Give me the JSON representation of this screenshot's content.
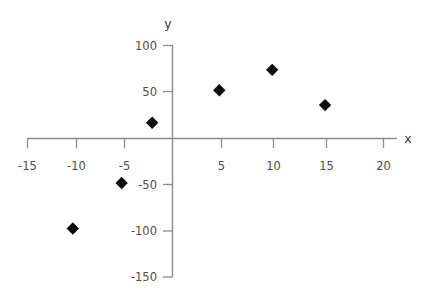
{
  "chart_data": {
    "type": "scatter",
    "title": "",
    "xlabel": "x",
    "ylabel": "y",
    "xlim": [
      -15,
      20
    ],
    "ylim": [
      -150,
      100
    ],
    "xticks": [
      -15,
      -10,
      -5,
      5,
      10,
      15,
      20
    ],
    "yticks": [
      100,
      50,
      -50,
      -100,
      -150
    ],
    "xtick_labels": [
      "-15",
      "-10",
      "-5",
      "5",
      "10",
      "15",
      "20"
    ],
    "ytick_labels": [
      "100",
      "50",
      "-50",
      "-100",
      "-150"
    ],
    "grid": false,
    "legend": null,
    "marker": "diamond",
    "marker_color": "#0d0d0d",
    "axis_color": "#8c8c8c",
    "points": [
      {
        "x": -9.8,
        "y": -97
      },
      {
        "x": -5.0,
        "y": -48
      },
      {
        "x": -2.0,
        "y": 17
      },
      {
        "x": 4.6,
        "y": 52
      },
      {
        "x": 9.8,
        "y": 74
      },
      {
        "x": 15.0,
        "y": 36
      }
    ]
  },
  "axes": {
    "x_title": "x",
    "y_title": "y"
  }
}
